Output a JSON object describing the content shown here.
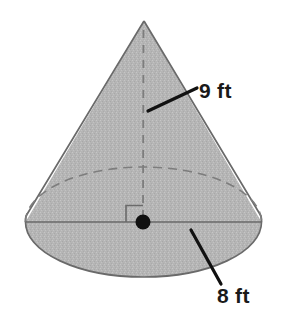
{
  "figure": {
    "name": "cone-diagram",
    "shape": "cone",
    "background_color": "#ffffff",
    "fill_color": "#b5b5b5",
    "outline_color": "#6a6a6a",
    "dash_color": "#7a7a7a",
    "label_color": "#1a1a1a",
    "leader_color": "#111111"
  },
  "labels": {
    "height": {
      "text": "9 ft",
      "value": 9,
      "unit": "ft",
      "measures": "height",
      "icon": "leader-line-icon"
    },
    "diameter": {
      "text": "8 ft",
      "value": 8,
      "unit": "ft",
      "measures": "diameter",
      "icon": "leader-line-icon"
    }
  },
  "markers": {
    "center_point": "center-dot",
    "right_angle": "right-angle-mark"
  },
  "geometry": {
    "apex": {
      "x": 144,
      "y": 21
    },
    "base_center": {
      "x": 143,
      "y": 222
    },
    "base_rx": 118,
    "base_ry": 55,
    "height_axis_style": "dashed",
    "hidden_arc_style": "dashed",
    "diameter_line_style": "solid"
  }
}
